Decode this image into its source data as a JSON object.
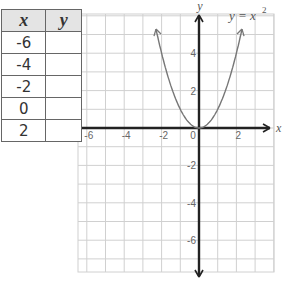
{
  "table": {
    "headers": [
      "x",
      "y"
    ],
    "rows": [
      {
        "x": "-6",
        "y": ""
      },
      {
        "x": "-4",
        "y": ""
      },
      {
        "x": "-2",
        "y": ""
      },
      {
        "x": "0",
        "y": ""
      },
      {
        "x": "2",
        "y": ""
      }
    ]
  },
  "chart_data": {
    "type": "line",
    "title": "",
    "function_label": "y = x²",
    "xlabel": "x",
    "ylabel": "y",
    "xlim": [
      -6.5,
      4
    ],
    "ylim": [
      -7.7,
      6.1
    ],
    "x_ticks": [
      -6,
      -4,
      -2,
      0,
      2
    ],
    "y_ticks": [
      4,
      2,
      -2,
      -4,
      -6
    ],
    "grid": true,
    "series": [
      {
        "name": "y = x^2",
        "x": [
          -2.3,
          -2,
          -1.5,
          -1,
          -0.5,
          0,
          0.5,
          1,
          1.5,
          2,
          2.3
        ],
        "y": [
          5.29,
          4,
          2.25,
          1,
          0.25,
          0,
          0.25,
          1,
          2.25,
          4,
          5.29
        ]
      }
    ]
  },
  "colors": {
    "grid": "#d0d0d0",
    "axes": "#222222",
    "curve": "#777777",
    "header_bg": "#e4e4e4"
  }
}
